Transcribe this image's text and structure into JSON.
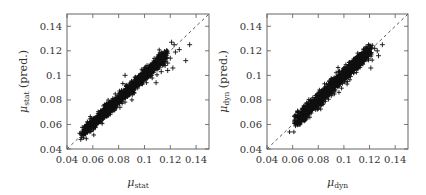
{
  "chart_data": [
    {
      "type": "scatter",
      "title": "",
      "xlabel": "μ_stat",
      "ylabel": "μ_stat (pred.)",
      "xlabel_main": "μ",
      "xlabel_sub": "stat",
      "ylabel_main": "μ",
      "ylabel_sub": "stat",
      "ylabel_suffix": " (pred.)",
      "xlim": [
        0.04,
        0.15
      ],
      "ylim": [
        0.04,
        0.15
      ],
      "xticks": [
        0.04,
        0.06,
        0.08,
        0.1,
        0.12,
        0.14
      ],
      "yticks": [
        0.04,
        0.06,
        0.08,
        0.1,
        0.12,
        0.14
      ],
      "xtick_labels": [
        "0.04",
        "0.06",
        "0.08",
        "0.1",
        "0.12",
        "0.14"
      ],
      "ytick_labels": [
        "0.04",
        "0.06",
        "0.08",
        "0.1",
        "0.12",
        "0.14"
      ],
      "grid": false,
      "legend": null,
      "reference_line": {
        "style": "dashed",
        "from": [
          0.04,
          0.04
        ],
        "to": [
          0.15,
          0.15
        ],
        "label": "y = x"
      },
      "marker": "+",
      "cluster": {
        "x_min": 0.052,
        "x_max": 0.116,
        "slope": 0.98,
        "intercept": 0.002,
        "spread": 0.0025,
        "n": 1400
      },
      "outliers": [
        [
          0.121,
          0.127
        ],
        [
          0.123,
          0.125
        ],
        [
          0.135,
          0.125
        ],
        [
          0.127,
          0.121
        ],
        [
          0.124,
          0.119
        ],
        [
          0.132,
          0.112
        ],
        [
          0.12,
          0.114
        ],
        [
          0.118,
          0.11
        ],
        [
          0.122,
          0.106
        ],
        [
          0.116,
          0.117
        ],
        [
          0.109,
          0.094
        ],
        [
          0.113,
          0.103
        ],
        [
          0.118,
          0.104
        ],
        [
          0.085,
          0.1
        ],
        [
          0.072,
          0.073
        ],
        [
          0.081,
          0.074
        ],
        [
          0.116,
          0.108
        ],
        [
          0.109,
          0.112
        ]
      ],
      "points_sample": [
        [
          0.052,
          0.054
        ],
        [
          0.056,
          0.056
        ],
        [
          0.06,
          0.06
        ],
        [
          0.064,
          0.064
        ],
        [
          0.068,
          0.068
        ],
        [
          0.072,
          0.071
        ],
        [
          0.076,
          0.076
        ],
        [
          0.08,
          0.08
        ],
        [
          0.084,
          0.084
        ],
        [
          0.088,
          0.088
        ],
        [
          0.092,
          0.092
        ],
        [
          0.096,
          0.096
        ],
        [
          0.1,
          0.1
        ],
        [
          0.104,
          0.104
        ],
        [
          0.108,
          0.107
        ],
        [
          0.112,
          0.111
        ],
        [
          0.116,
          0.115
        ]
      ]
    },
    {
      "type": "scatter",
      "title": "",
      "xlabel": "μ_dyn",
      "ylabel": "μ_dyn (pred.)",
      "xlabel_main": "μ",
      "xlabel_sub": "dyn",
      "ylabel_main": "μ",
      "ylabel_sub": "dyn",
      "ylabel_suffix": " (pred.)",
      "xlim": [
        0.04,
        0.15
      ],
      "ylim": [
        0.04,
        0.15
      ],
      "xticks": [
        0.04,
        0.06,
        0.08,
        0.1,
        0.12,
        0.14
      ],
      "yticks": [
        0.04,
        0.06,
        0.08,
        0.1,
        0.12,
        0.14
      ],
      "xtick_labels": [
        "0.04",
        "0.06",
        "0.08",
        "0.1",
        "0.12",
        "0.14"
      ],
      "ytick_labels": [
        "0.04",
        "0.06",
        "0.08",
        "0.1",
        "0.12",
        "0.14"
      ],
      "grid": false,
      "legend": null,
      "reference_line": {
        "style": "dashed",
        "from": [
          0.04,
          0.04
        ],
        "to": [
          0.15,
          0.15
        ],
        "label": "y = x"
      },
      "marker": "+",
      "cluster": {
        "x_min": 0.062,
        "x_max": 0.12,
        "slope": 1.0,
        "intercept": 0.0,
        "spread": 0.0028,
        "n": 1400
      },
      "outliers": [
        [
          0.13,
          0.125
        ],
        [
          0.127,
          0.116
        ],
        [
          0.126,
          0.12
        ],
        [
          0.121,
          0.106
        ],
        [
          0.124,
          0.122
        ],
        [
          0.071,
          0.074
        ],
        [
          0.08,
          0.073
        ],
        [
          0.064,
          0.071
        ],
        [
          0.119,
          0.117
        ]
      ],
      "points_sample": [
        [
          0.062,
          0.061
        ],
        [
          0.066,
          0.066
        ],
        [
          0.07,
          0.07
        ],
        [
          0.074,
          0.074
        ],
        [
          0.078,
          0.078
        ],
        [
          0.082,
          0.082
        ],
        [
          0.086,
          0.086
        ],
        [
          0.09,
          0.09
        ],
        [
          0.094,
          0.094
        ],
        [
          0.098,
          0.098
        ],
        [
          0.102,
          0.102
        ],
        [
          0.106,
          0.106
        ],
        [
          0.11,
          0.11
        ],
        [
          0.114,
          0.114
        ],
        [
          0.118,
          0.118
        ]
      ]
    }
  ]
}
